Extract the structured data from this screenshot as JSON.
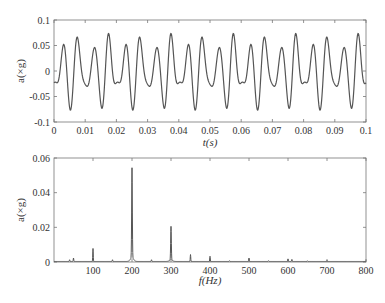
{
  "chart_data": [
    {
      "type": "line",
      "title": "",
      "xlabel": "t(s)",
      "ylabel": "a(×g)",
      "xlim": [
        0,
        0.1
      ],
      "ylim": [
        -0.1,
        0.1
      ],
      "xticks": [
        "0",
        "0.01",
        "0.02",
        "0.03",
        "0.04",
        "0.05",
        "0.06",
        "0.07",
        "0.08",
        "0.09",
        "0.1"
      ],
      "yticks": [
        "0.1",
        "0.05",
        "0",
        "-0.05",
        "-0.1"
      ],
      "grid": false,
      "series": [
        {
          "name": "acceleration",
          "color": "#555555",
          "description": "periodic vibration signal, ~100 Hz fundamental with strong 200 Hz and 300 Hz harmonics; peaks ~0.05-0.075, troughs ~-0.04 to -0.08",
          "components": [
            {
              "freq_hz": 100,
              "amp": 0.008
            },
            {
              "freq_hz": 200,
              "amp": 0.052
            },
            {
              "freq_hz": 300,
              "amp": 0.02
            },
            {
              "freq_hz": 350,
              "amp": 0.004
            },
            {
              "freq_hz": 400,
              "amp": 0.003
            }
          ]
        }
      ]
    },
    {
      "type": "line",
      "title": "",
      "xlabel": "f(Hz)",
      "ylabel": "a(×g)",
      "xlim": [
        0,
        800
      ],
      "ylim": [
        0,
        0.06
      ],
      "xticks": [
        "100",
        "200",
        "300",
        "400",
        "500",
        "600",
        "700",
        "800"
      ],
      "yticks": [
        "0.06",
        "0.04",
        "0.02",
        "0"
      ],
      "grid": false,
      "series": [
        {
          "name": "spectrum",
          "color": "#555555",
          "peaks": [
            {
              "x": 40,
              "y": 0.001
            },
            {
              "x": 50,
              "y": 0.002
            },
            {
              "x": 100,
              "y": 0.0075
            },
            {
              "x": 150,
              "y": 0.001
            },
            {
              "x": 200,
              "y": 0.052
            },
            {
              "x": 250,
              "y": 0.001
            },
            {
              "x": 300,
              "y": 0.0195
            },
            {
              "x": 350,
              "y": 0.004
            },
            {
              "x": 400,
              "y": 0.003
            },
            {
              "x": 450,
              "y": 0.0005
            },
            {
              "x": 500,
              "y": 0.002
            },
            {
              "x": 550,
              "y": 0.0005
            },
            {
              "x": 600,
              "y": 0.0015
            },
            {
              "x": 610,
              "y": 0.0012
            },
            {
              "x": 650,
              "y": 0.0004
            },
            {
              "x": 700,
              "y": 0.0006
            },
            {
              "x": 800,
              "y": 0.0005
            }
          ]
        }
      ]
    }
  ],
  "top_chart": {
    "xlabel": "t(s)",
    "ylabel": "a(×g)",
    "xticks": [
      "0",
      "0.01",
      "0.02",
      "0.03",
      "0.04",
      "0.05",
      "0.06",
      "0.07",
      "0.08",
      "0.09",
      "0.1"
    ],
    "yticks": [
      "0.1",
      "0.05",
      "0",
      "-0.05",
      "-0.1"
    ]
  },
  "bottom_chart": {
    "xlabel": "f(Hz)",
    "ylabel": "a(×g)",
    "xticks": [
      "100",
      "200",
      "300",
      "400",
      "500",
      "600",
      "700",
      "800"
    ],
    "yticks": [
      "0.06",
      "0.04",
      "0.02",
      "0"
    ]
  }
}
